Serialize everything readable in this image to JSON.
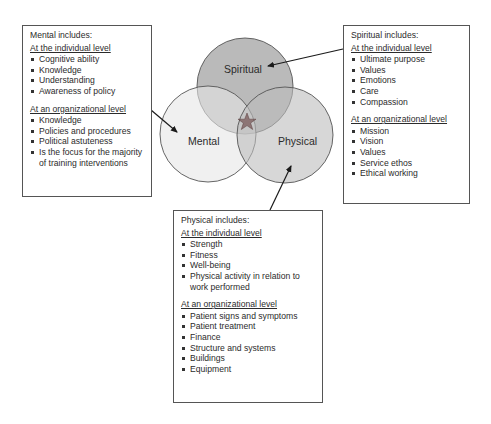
{
  "venn": {
    "circles": [
      {
        "label": "Spiritual",
        "cx": 245,
        "cy": 86,
        "r": 48,
        "fill": "#8c8c8c"
      },
      {
        "label": "Mental",
        "cx": 208,
        "cy": 134,
        "r": 48,
        "fill": "#e6e6e6"
      },
      {
        "label": "Physical",
        "cx": 285,
        "cy": 135,
        "r": 48,
        "fill": "#bdbdbd"
      }
    ],
    "center_marker": "star",
    "center_marker_color": "#7a5a5a"
  },
  "mental": {
    "title": "Mental includes:",
    "individual_heading": "At the individual level",
    "individual_items": [
      "Cognitive ability",
      "Knowledge",
      "Understanding",
      "Awareness of policy"
    ],
    "organizational_heading": "At an organizational level",
    "organizational_items": [
      "Knowledge",
      "Policies and procedures",
      "Political astuteness",
      "Is the focus for the majority of training interventions"
    ]
  },
  "spiritual": {
    "title": "Spiritual includes:",
    "individual_heading": "At the individual level",
    "individual_items": [
      "Ultimate purpose",
      "Values",
      "Emotions",
      "Care",
      "Compassion"
    ],
    "organizational_heading": "At an organizational level",
    "organizational_items": [
      "Mission",
      "Vision",
      "Values",
      "Service ethos",
      "Ethical working"
    ]
  },
  "physical": {
    "title": "Physical includes:",
    "individual_heading": "At the individual level",
    "individual_items": [
      "Strength",
      "Fitness",
      "Well-being",
      "Physical activity in relation to work performed"
    ],
    "organizational_heading": "At an organizational level",
    "organizational_items": [
      "Patient signs and symptoms",
      "Patient treatment",
      "Finance",
      "Structure and systems",
      "Buildings",
      "Equipment"
    ]
  }
}
